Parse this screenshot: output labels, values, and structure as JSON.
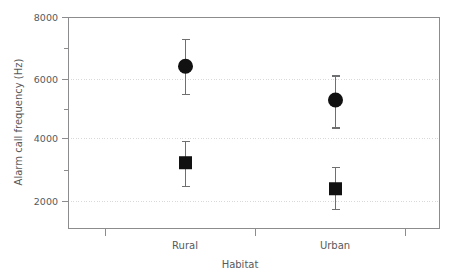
{
  "chart_data": {
    "type": "scatter",
    "title": "",
    "xlabel": "Habitat",
    "ylabel": "Alarm call frequency (Hz)",
    "categories": [
      "Rural",
      "Urban"
    ],
    "ylim": [
      1000,
      8000
    ],
    "yticks": [
      2000,
      4000,
      6000,
      8000
    ],
    "ytick_labels": [
      "2000",
      "4000",
      "6000",
      "8000"
    ],
    "minor_yticks": [
      3000,
      5000,
      7000
    ],
    "grid": "horizontal-dotted-at-major-yticks",
    "legend": "none",
    "error_type": "error bars with caps",
    "series": [
      {
        "name": "circle-series",
        "marker": "circle",
        "color": "#111111",
        "points": [
          {
            "category": "Rural",
            "x_px": 185,
            "value": 6400,
            "err_low": 5500,
            "err_high": 7300
          },
          {
            "category": "Urban",
            "x_px": 335,
            "value": 5300,
            "err_low": 4400,
            "err_high": 6100
          }
        ]
      },
      {
        "name": "square-series",
        "marker": "square",
        "color": "#111111",
        "points": [
          {
            "category": "Rural",
            "x_px": 185,
            "value": 3250,
            "err_low": 2500,
            "err_high": 3950
          },
          {
            "category": "Urban",
            "x_px": 335,
            "value": 2400,
            "err_low": 1750,
            "err_high": 3100
          }
        ]
      }
    ],
    "xticks_px": [
      105,
      255,
      405
    ],
    "plot_frame": {
      "left": 68,
      "right": 440,
      "top": 17,
      "bottom": 228
    }
  },
  "axis": {
    "y_title": "Alarm call frequency (Hz)",
    "x_title": "Habitat",
    "y_labels": [
      "8000",
      "6000",
      "4000",
      "2000"
    ],
    "x_labels": [
      "Rural",
      "Urban"
    ]
  }
}
